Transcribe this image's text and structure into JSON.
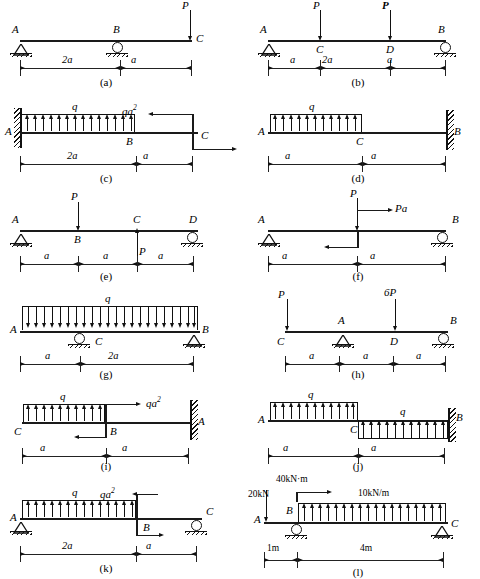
{
  "figure": {
    "type": "beam-load-diagrams",
    "panel_count": 12
  },
  "panels": [
    {
      "id": "a",
      "caption": "(a)",
      "nodes": [
        "A",
        "B",
        "C"
      ],
      "supports": [
        {
          "at": "A",
          "type": "pin"
        },
        {
          "at": "B",
          "type": "roller"
        }
      ],
      "loads": [
        {
          "label": "P",
          "type": "point",
          "at": "C",
          "direction": "down"
        }
      ],
      "dimensions": [
        "2a",
        "a"
      ]
    },
    {
      "id": "b",
      "caption": "(b)",
      "nodes": [
        "A",
        "C",
        "D",
        "B"
      ],
      "supports": [
        {
          "at": "A",
          "type": "pin"
        },
        {
          "at": "B",
          "type": "roller"
        }
      ],
      "loads": [
        {
          "label": "P",
          "type": "point",
          "at": "C",
          "direction": "down"
        },
        {
          "label": "P",
          "type": "point",
          "at": "D",
          "direction": "down",
          "bold": true
        }
      ],
      "dimensions": [
        "a",
        "2a",
        "a"
      ]
    },
    {
      "id": "c",
      "caption": "(c)",
      "nodes": [
        "A",
        "B",
        "C"
      ],
      "supports": [
        {
          "at": "A",
          "type": "fixed-wall-left"
        }
      ],
      "loads": [
        {
          "label": "q",
          "type": "distributed",
          "span": "A-B",
          "direction": "up"
        },
        {
          "label": "qa²",
          "type": "moment-couple",
          "at": "C"
        }
      ],
      "dimensions": [
        "2a",
        "a"
      ]
    },
    {
      "id": "d",
      "caption": "(d)",
      "nodes": [
        "A",
        "C",
        "B"
      ],
      "supports": [
        {
          "at": "B",
          "type": "fixed-wall-right"
        }
      ],
      "loads": [
        {
          "label": "q",
          "type": "distributed",
          "span": "A-C",
          "direction": "up"
        }
      ],
      "dimensions": [
        "a",
        "a"
      ]
    },
    {
      "id": "e",
      "caption": "(e)",
      "nodes": [
        "A",
        "B",
        "C",
        "D"
      ],
      "supports": [
        {
          "at": "A",
          "type": "pin"
        },
        {
          "at": "D",
          "type": "roller"
        }
      ],
      "loads": [
        {
          "label": "P",
          "type": "point",
          "at": "B",
          "direction": "down"
        },
        {
          "label": "P",
          "type": "point",
          "at": "C",
          "direction": "up"
        }
      ],
      "dimensions": [
        "a",
        "a",
        "a"
      ]
    },
    {
      "id": "f",
      "caption": "(f)",
      "nodes": [
        "A",
        "B"
      ],
      "supports": [
        {
          "at": "A",
          "type": "pin"
        },
        {
          "at": "B",
          "type": "roller"
        }
      ],
      "loads": [
        {
          "label": "P",
          "type": "point",
          "at": "mid",
          "direction": "down"
        },
        {
          "label": "Pa",
          "type": "moment-couple",
          "at": "mid"
        }
      ],
      "dimensions": [
        "a",
        "a"
      ]
    },
    {
      "id": "g",
      "caption": "(g)",
      "nodes": [
        "A",
        "C",
        "B"
      ],
      "supports": [
        {
          "at": "C",
          "type": "roller"
        },
        {
          "at": "B",
          "type": "pin"
        }
      ],
      "loads": [
        {
          "label": "q",
          "type": "distributed",
          "span": "A-B",
          "direction": "down"
        }
      ],
      "dimensions": [
        "a",
        "2a"
      ]
    },
    {
      "id": "h",
      "caption": "(h)",
      "nodes": [
        "C",
        "A",
        "D",
        "B"
      ],
      "supports": [
        {
          "at": "A",
          "type": "pin"
        },
        {
          "at": "B",
          "type": "roller"
        }
      ],
      "loads": [
        {
          "label": "P",
          "type": "point",
          "at": "C",
          "direction": "down"
        },
        {
          "label": "6P",
          "type": "point",
          "at": "D",
          "direction": "down"
        }
      ],
      "dimensions": [
        "a",
        "a",
        "a"
      ]
    },
    {
      "id": "i",
      "caption": "(i)",
      "nodes": [
        "C",
        "B",
        "A"
      ],
      "supports": [
        {
          "at": "A",
          "type": "fixed-wall-right"
        }
      ],
      "loads": [
        {
          "label": "q",
          "type": "distributed",
          "span": "C-B",
          "direction": "up"
        },
        {
          "label": "qa²",
          "type": "moment-couple",
          "at": "B"
        }
      ],
      "dimensions": [
        "a",
        "a"
      ]
    },
    {
      "id": "j",
      "caption": "(j)",
      "nodes": [
        "A",
        "C",
        "B"
      ],
      "supports": [
        {
          "at": "B",
          "type": "fixed-wall-right"
        }
      ],
      "loads": [
        {
          "label": "q",
          "type": "distributed",
          "span": "A-C",
          "direction": "up"
        },
        {
          "label": "q",
          "type": "distributed",
          "span": "C-B",
          "direction": "up"
        }
      ],
      "dimensions": [
        "a",
        "a"
      ]
    },
    {
      "id": "k",
      "caption": "(k)",
      "nodes": [
        "A",
        "B",
        "C"
      ],
      "supports": [
        {
          "at": "A",
          "type": "pin"
        },
        {
          "at": "C",
          "type": "roller"
        }
      ],
      "loads": [
        {
          "label": "q",
          "type": "distributed",
          "span": "A-B",
          "direction": "up"
        },
        {
          "label": "qa²",
          "type": "moment-couple",
          "at": "B"
        }
      ],
      "dimensions": [
        "2a",
        "a"
      ]
    },
    {
      "id": "l",
      "caption": "(l)",
      "nodes": [
        "A",
        "B",
        "C"
      ],
      "supports": [
        {
          "at": "B",
          "type": "roller"
        },
        {
          "at": "C",
          "type": "pin"
        }
      ],
      "loads": [
        {
          "label": "20kN",
          "type": "point",
          "at": "A",
          "direction": "down"
        },
        {
          "label": "40kN·m",
          "type": "moment-couple",
          "at": "B"
        },
        {
          "label": "10kN/m",
          "type": "distributed",
          "span": "B-C",
          "direction": "up"
        }
      ],
      "dimensions": [
        "1m",
        "4m"
      ]
    }
  ],
  "labels": {
    "A": "A",
    "B": "B",
    "C": "C",
    "D": "D",
    "P": "P",
    "q": "q",
    "sixP": "6P",
    "Pa": "Pa",
    "qa2_base": "qa",
    "qa2_exp": "2",
    "a": "a",
    "twoa": "2a",
    "kn20": "20kN",
    "knm40": "40kN·m",
    "knpm10": "10kN/m",
    "m1": "1m",
    "m4": "4m"
  },
  "captions": {
    "a": "(a)",
    "b": "(b)",
    "c": "(c)",
    "d": "(d)",
    "e": "(e)",
    "f": "(f)",
    "g": "(g)",
    "h": "(h)",
    "i": "(i)",
    "j": "(j)",
    "k": "(k)",
    "l": "(l)"
  },
  "colors": {
    "ink": "#1a1a1a",
    "background": "#ffffff"
  }
}
